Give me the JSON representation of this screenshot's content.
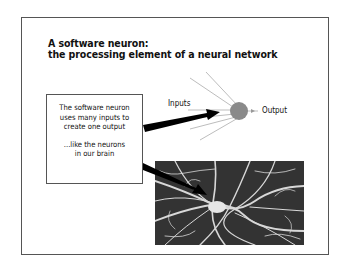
{
  "slide": {
    "title_line1": "A software neuron:",
    "title_line2": "the processing element of a neural network",
    "callout": {
      "line1": "The software neuron",
      "line2": "uses many inputs to",
      "line3": "create one output",
      "line4": "...like the neurons",
      "line5": "in our brain"
    },
    "diagram": {
      "inputs_label": "Inputs",
      "output_label": "Output",
      "neuron_color": "#8a8a8a",
      "input_line_color": "#bbbbbb"
    },
    "photo": {
      "description": "micrograph of biological neurons"
    }
  }
}
